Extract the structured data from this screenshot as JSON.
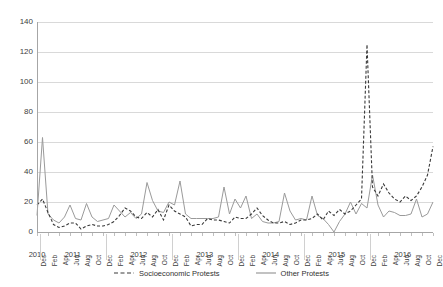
{
  "chart_data": {
    "type": "line",
    "title": "",
    "xlabel": "",
    "ylabel": "",
    "ylim": [
      0,
      140
    ],
    "yticks": [
      0,
      20,
      40,
      60,
      80,
      100,
      120,
      140
    ],
    "grid": true,
    "legend_position": "bottom",
    "x": [
      "Dec 2010",
      "Jan 2011",
      "Feb 2011",
      "Mar 2011",
      "Apr 2011",
      "May 2011",
      "Jun 2011",
      "Jul 2011",
      "Aug 2011",
      "Sep 2011",
      "Oct 2011",
      "Nov 2011",
      "Dec 2011",
      "Jan 2012",
      "Feb 2012",
      "Mar 2012",
      "Apr 2012",
      "May 2012",
      "Jun 2012",
      "Jul 2012",
      "Aug 2012",
      "Sep 2012",
      "Oct 2012",
      "Nov 2012",
      "Dec 2012",
      "Jan 2013",
      "Feb 2013",
      "Mar 2013",
      "Apr 2013",
      "May 2013",
      "Jun 2013",
      "Jul 2013",
      "Aug 2013",
      "Sep 2013",
      "Oct 2013",
      "Nov 2013",
      "Dec 2013",
      "Jan 2014",
      "Feb 2014",
      "Mar 2014",
      "Apr 2014",
      "May 2014",
      "Jun 2014",
      "Jul 2014",
      "Aug 2014",
      "Sep 2014",
      "Oct 2014",
      "Nov 2014",
      "Dec 2014",
      "Jan 2015",
      "Feb 2015",
      "Mar 2015",
      "Apr 2015",
      "May 2015",
      "Jun 2015",
      "Jul 2015",
      "Aug 2015",
      "Sep 2015",
      "Oct 2015",
      "Nov 2015",
      "Dec 2015",
      "Jan 2016",
      "Feb 2016",
      "Mar 2016",
      "Apr 2016",
      "May 2016",
      "Jun 2016",
      "Jul 2016",
      "Aug 2016",
      "Sep 2016",
      "Oct 2016",
      "Nov 2016",
      "Dec 2016"
    ],
    "tick_labels": [
      "Dec",
      "Feb",
      "Apr",
      "Jun",
      "Aug",
      "Oct",
      "Dec",
      "Feb",
      "Apr",
      "Jun",
      "Aug",
      "Oct",
      "Dec",
      "Feb",
      "Apr",
      "Jun",
      "Aug",
      "Oct",
      "Dec",
      "Feb",
      "Apr",
      "Jun",
      "Aug",
      "Oct",
      "Dec",
      "Feb",
      "Apr",
      "Jun",
      "Aug",
      "Oct",
      "Dec",
      "Feb",
      "Apr",
      "Jun",
      "Aug",
      "Oct",
      "Dec"
    ],
    "years": [
      "2010",
      "2011",
      "2012",
      "2013",
      "2014",
      "2015",
      "2016"
    ],
    "series": [
      {
        "name": "Socioeconomic Protests",
        "style": "dashed",
        "color": "#3a3a3a",
        "values": [
          18,
          22,
          13,
          5,
          3,
          4,
          6,
          6,
          2,
          4,
          5,
          4,
          4,
          5,
          7,
          11,
          16,
          14,
          10,
          9,
          13,
          10,
          15,
          8,
          18,
          14,
          12,
          10,
          4,
          5,
          5,
          9,
          8,
          8,
          7,
          6,
          10,
          9,
          9,
          12,
          16,
          11,
          8,
          6,
          6,
          7,
          5,
          6,
          8,
          8,
          9,
          12,
          8,
          14,
          11,
          15,
          12,
          14,
          18,
          22,
          125,
          30,
          24,
          32,
          26,
          22,
          20,
          24,
          21,
          24,
          30,
          38,
          57
        ]
      },
      {
        "name": "Other Protests",
        "style": "solid",
        "color": "#9a9a9a",
        "values": [
          11,
          63,
          12,
          8,
          6,
          10,
          18,
          9,
          8,
          19,
          10,
          7,
          8,
          9,
          18,
          14,
          10,
          13,
          9,
          12,
          33,
          21,
          14,
          13,
          20,
          18,
          34,
          12,
          9,
          9,
          9,
          9,
          9,
          10,
          30,
          12,
          22,
          16,
          24,
          9,
          12,
          7,
          6,
          6,
          7,
          26,
          14,
          8,
          9,
          8,
          24,
          11,
          9,
          5,
          0,
          7,
          12,
          20,
          12,
          19,
          16,
          38,
          18,
          10,
          14,
          13,
          11,
          11,
          12,
          22,
          10,
          12,
          20
        ]
      }
    ]
  },
  "legend": {
    "items": [
      {
        "label": "Socioeconomic Protests",
        "style": "dashed"
      },
      {
        "label": "Other Protests",
        "style": "solid"
      }
    ]
  }
}
